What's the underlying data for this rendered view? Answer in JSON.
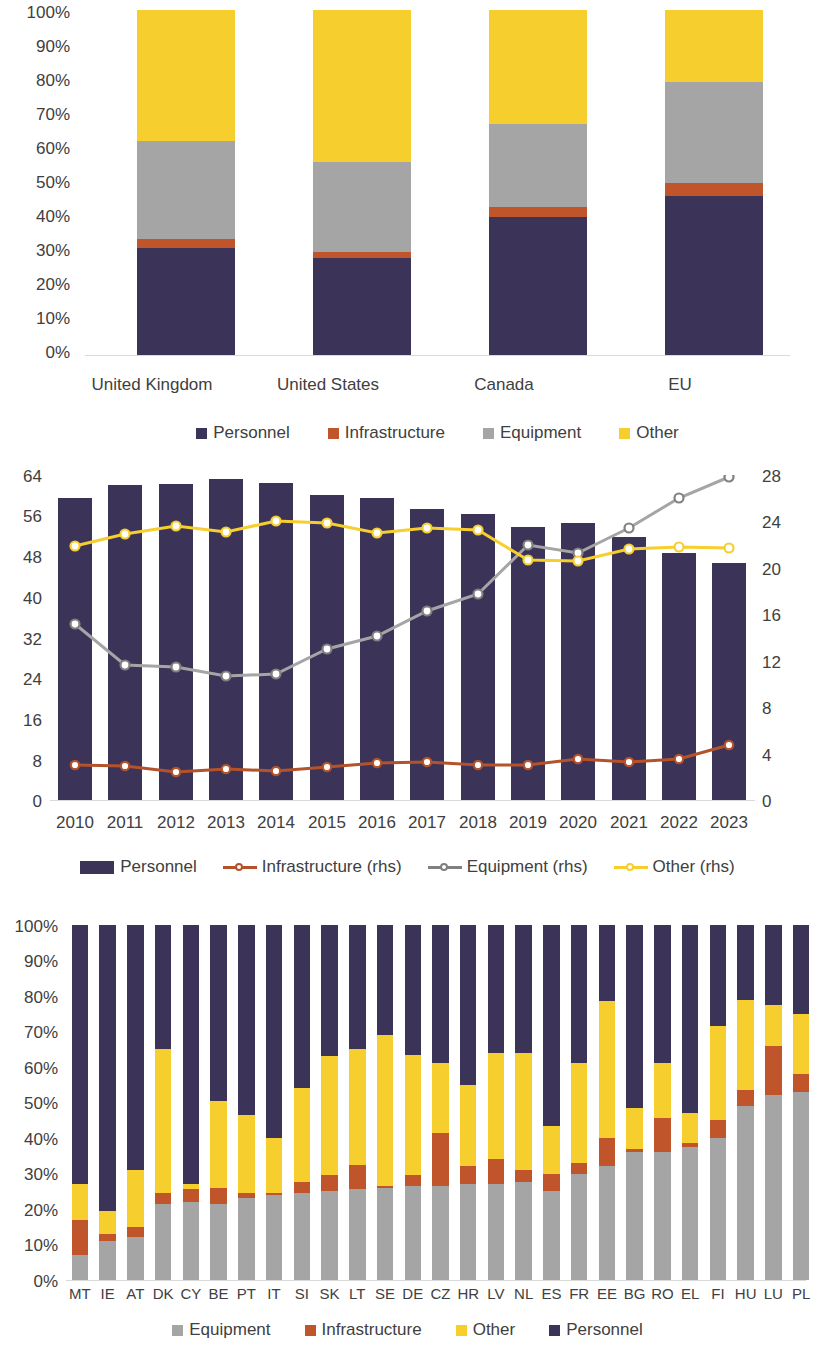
{
  "colors": {
    "personnel": "#3B3358",
    "infrastructure": "#C0552C",
    "equipment": "#A5A5A5",
    "other": "#F6CE2E",
    "axis": "#D9D9D9",
    "text": "#404040"
  },
  "chart_data": [
    {
      "id": "chart-1-country-shares",
      "type": "bar",
      "stacked": true,
      "normalized": true,
      "title": "",
      "xlabel": "",
      "ylabel": "",
      "ylim": [
        0,
        100
      ],
      "yticks": [
        "0%",
        "10%",
        "20%",
        "30%",
        "40%",
        "50%",
        "60%",
        "70%",
        "80%",
        "90%",
        "100%"
      ],
      "categories": [
        "United Kingdom",
        "United States",
        "Canada",
        "EU"
      ],
      "legend": [
        "Personnel",
        "Infrastructure",
        "Equipment",
        "Other"
      ],
      "legend_position": "bottom",
      "series": [
        {
          "name": "Personnel",
          "values": [
            31,
            28,
            40,
            46
          ]
        },
        {
          "name": "Infrastructure",
          "values": [
            2.5,
            2,
            3,
            4
          ]
        },
        {
          "name": "Equipment",
          "values": [
            28.5,
            26,
            24,
            29
          ]
        },
        {
          "name": "Other",
          "values": [
            38,
            44,
            33,
            21
          ]
        }
      ]
    },
    {
      "id": "chart-2-eu-time-series",
      "type": "bar+line",
      "title": "",
      "xlabel": "",
      "ylabel": "",
      "ylim": [
        0,
        64
      ],
      "yticks": [
        "0",
        "8",
        "16",
        "24",
        "32",
        "40",
        "48",
        "56",
        "64"
      ],
      "y2lim": [
        0,
        28
      ],
      "y2ticks": [
        "0",
        "4",
        "8",
        "12",
        "16",
        "20",
        "24",
        "28"
      ],
      "categories": [
        "2010",
        "2011",
        "2012",
        "2013",
        "2014",
        "2015",
        "2016",
        "2017",
        "2018",
        "2019",
        "2020",
        "2021",
        "2022",
        "2023"
      ],
      "legend": [
        "Personnel",
        "Infrastructure (rhs)",
        "Equipment (rhs)",
        "Other (rhs)"
      ],
      "legend_position": "bottom",
      "series": [
        {
          "name": "Personnel",
          "axis": "left",
          "kind": "bar",
          "values": [
            59.5,
            62.0,
            62.2,
            63.3,
            62.4,
            60.0,
            59.4,
            57.3,
            56.3,
            53.8,
            54.5,
            51.8,
            48.6,
            46.6
          ]
        },
        {
          "name": "Infrastructure (rhs)",
          "axis": "right",
          "kind": "line",
          "values": [
            3.0,
            2.9,
            2.4,
            2.7,
            2.5,
            2.8,
            3.2,
            3.3,
            3.0,
            3.0,
            3.5,
            3.3,
            3.5,
            4.7
          ]
        },
        {
          "name": "Equipment (rhs)",
          "axis": "right",
          "kind": "line",
          "values": [
            15.1,
            11.6,
            11.5,
            10.7,
            10.9,
            13.0,
            14.1,
            16.3,
            17.7,
            22.0,
            21.3,
            23.4,
            26.0,
            27.8
          ]
        },
        {
          "name": "Other (rhs)",
          "axis": "right",
          "kind": "line",
          "values": [
            21.9,
            22.9,
            23.6,
            23.1,
            24.0,
            23.9,
            23.0,
            23.4,
            23.3,
            20.7,
            20.6,
            21.6,
            21.8,
            21.7
          ]
        }
      ]
    },
    {
      "id": "chart-3-eu-member-states",
      "type": "bar",
      "stacked": true,
      "normalized": true,
      "title": "",
      "xlabel": "",
      "ylabel": "",
      "ylim": [
        0,
        100
      ],
      "yticks": [
        "0%",
        "10%",
        "20%",
        "30%",
        "40%",
        "50%",
        "60%",
        "70%",
        "80%",
        "90%",
        "100%"
      ],
      "categories": [
        "MT",
        "IE",
        "AT",
        "DK",
        "CY",
        "BE",
        "PT",
        "IT",
        "SI",
        "SK",
        "LT",
        "SE",
        "DE",
        "CZ",
        "HR",
        "LV",
        "NL",
        "ES",
        "FR",
        "EE",
        "BG",
        "RO",
        "EL",
        "FI",
        "HU",
        "LU",
        "PL"
      ],
      "legend": [
        "Equipment",
        "Infrastructure",
        "Other",
        "Personnel"
      ],
      "legend_position": "bottom",
      "series": [
        {
          "name": "Equipment",
          "values": [
            7,
            11,
            12,
            21.5,
            22,
            21.5,
            23,
            24,
            24.5,
            25,
            25.5,
            26,
            26.5,
            26.5,
            27,
            27,
            27.5,
            25,
            30,
            32,
            36,
            36,
            37.5,
            40,
            49,
            52,
            53
          ]
        },
        {
          "name": "Infrastructure",
          "values": [
            10,
            2,
            3,
            3,
            3.5,
            4.5,
            1.5,
            0.5,
            3,
            4.5,
            7,
            0.5,
            3,
            15,
            5,
            7,
            3.5,
            5,
            3,
            8,
            1,
            9.5,
            1,
            5,
            4.5,
            14,
            5
          ]
        },
        {
          "name": "Other",
          "values": [
            10,
            6.5,
            16,
            40.5,
            1.5,
            24.5,
            22,
            15.5,
            26.5,
            33.5,
            32.5,
            42.5,
            34,
            19.5,
            23,
            30,
            33,
            13.5,
            28,
            38.5,
            11.5,
            15.5,
            8.5,
            26.5,
            25.5,
            11.5,
            17
          ]
        },
        {
          "name": "Personnel",
          "values": [
            73,
            80.5,
            69,
            35,
            73,
            49.5,
            53.5,
            60,
            46,
            37,
            35,
            31,
            36.5,
            39,
            45,
            36,
            36,
            56.5,
            39,
            21.5,
            51.5,
            39,
            53,
            28.5,
            21,
            22.5,
            25
          ]
        }
      ]
    }
  ]
}
